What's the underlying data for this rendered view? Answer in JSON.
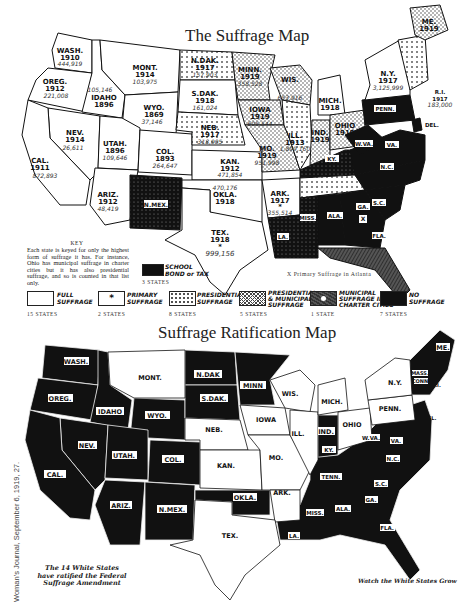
{
  "map1": {
    "title": "The Suffrage Map",
    "states": [
      {
        "abbr": "WASH.",
        "year": "1910",
        "count": "444,919",
        "category": "full"
      },
      {
        "abbr": "OREG.",
        "year": "1912",
        "count": "221,008",
        "category": "full"
      },
      {
        "abbr": "IDAHO",
        "year": "1896",
        "count": "105,146",
        "category": "full"
      },
      {
        "abbr": "MONT.",
        "year": "1914",
        "count": "103,975",
        "category": "full"
      },
      {
        "abbr": "WYO.",
        "year": "1869",
        "count": "37,146",
        "category": "full"
      },
      {
        "abbr": "NEV.",
        "year": "1914",
        "count": "26,611",
        "category": "full"
      },
      {
        "abbr": "CAL.",
        "year": "1911",
        "count": "872,893",
        "category": "full"
      },
      {
        "abbr": "UTAH.",
        "year": "1896",
        "count": "109,646",
        "category": "full"
      },
      {
        "abbr": "COL.",
        "year": "1893",
        "count": "264,647",
        "category": "full"
      },
      {
        "abbr": "ARIZ.",
        "year": "1912",
        "count": "48,419",
        "category": "full"
      },
      {
        "abbr": "N.MEX.",
        "year": "",
        "count": "",
        "category": "school-bond-tax"
      },
      {
        "abbr": "KAN.",
        "year": "1912",
        "count": "471,854",
        "category": "full"
      },
      {
        "abbr": "OKLA.",
        "year": "1918",
        "count": "470,176",
        "category": "full"
      },
      {
        "abbr": "TEX.",
        "year": "1918",
        "count": "999,156",
        "category": "primary"
      },
      {
        "abbr": "ARK.",
        "year": "1917",
        "count": "355,514",
        "category": "primary"
      },
      {
        "abbr": "N.DAK.",
        "year": "1917",
        "count": "157,903",
        "category": "presidential-municipal"
      },
      {
        "abbr": "S.DAK.",
        "year": "1918",
        "count": "161,024",
        "category": "full"
      },
      {
        "abbr": "NEB.",
        "year": "1917",
        "count": "318,905",
        "category": "presidential-municipal"
      },
      {
        "abbr": "MINN.",
        "year": "1919",
        "count": "358,528",
        "category": "presidential"
      },
      {
        "abbr": "WIS.",
        "year": "",
        "count": "653,916",
        "category": "presidential"
      },
      {
        "abbr": "IOWA",
        "year": "1919",
        "count": "605,544",
        "category": "presidential"
      },
      {
        "abbr": "MO.",
        "year": "1919",
        "count": "951,998",
        "category": "presidential"
      },
      {
        "abbr": "ILL.",
        "year": "1913",
        "count": "1,899,160",
        "category": "presidential-municipal"
      },
      {
        "abbr": "MICH.",
        "year": "1918",
        "count": "",
        "category": "full"
      },
      {
        "abbr": "IND.",
        "year": "1919",
        "count": "850,484",
        "category": "presidential"
      },
      {
        "abbr": "OHIO",
        "year": "1919",
        "count": "",
        "category": "presidential"
      },
      {
        "abbr": "N.Y.",
        "year": "1917",
        "count": "3,125,999",
        "category": "full"
      },
      {
        "abbr": "ME.",
        "year": "1919",
        "count": "",
        "category": "presidential"
      },
      {
        "abbr": "R.I.",
        "year": "1917",
        "count": "183,000",
        "category": "presidential"
      },
      {
        "abbr": "VT.",
        "year": "1917",
        "count": "",
        "category": "presidential-municipal"
      },
      {
        "abbr": "PENN.",
        "year": "",
        "count": "",
        "category": "none"
      },
      {
        "abbr": "DEL.",
        "year": "",
        "count": "",
        "category": "none"
      },
      {
        "abbr": "W.VA.",
        "year": "",
        "count": "",
        "category": "none"
      },
      {
        "abbr": "VA.",
        "year": "",
        "count": "",
        "category": "none"
      },
      {
        "abbr": "KY.",
        "year": "",
        "count": "",
        "category": "school-bond-tax"
      },
      {
        "abbr": "TENN.",
        "year": "1919",
        "count": "",
        "category": "presidential-municipal"
      },
      {
        "abbr": "N.C.",
        "year": "",
        "count": "",
        "category": "none"
      },
      {
        "abbr": "S.C.",
        "year": "",
        "count": "",
        "category": "none"
      },
      {
        "abbr": "GA.",
        "year": "",
        "count": "",
        "category": "none"
      },
      {
        "abbr": "ALA.",
        "year": "",
        "count": "",
        "category": "none"
      },
      {
        "abbr": "MISS.",
        "year": "",
        "count": "",
        "category": "school-bond-tax"
      },
      {
        "abbr": "LA.",
        "year": "",
        "count": "",
        "category": "school-bond-tax"
      },
      {
        "abbr": "FLA.",
        "year": "",
        "count": "",
        "category": "municipal-charter"
      }
    ],
    "key": {
      "heading": "KEY",
      "text": "Each state is keyed for only the highest form of suffrage it has. For instance, Ohio has municipal suffrage in charter cities but it has also presidential suffrage, and so is counted in that list only."
    },
    "school_bond_tax": {
      "label_line1": "SCHOOL",
      "label_line2": "BOND or TAX",
      "count": "3 STATES"
    },
    "atlanta_note": "X Primary Suffrage in Atlanta",
    "legend": [
      {
        "id": "full",
        "line1": "FULL",
        "line2": "SUFFRAGE",
        "count": "15 STATES"
      },
      {
        "id": "primary",
        "line1": "PRIMARY",
        "line2": "SUFFRAGE",
        "count": "2 STATES",
        "symbol": "*"
      },
      {
        "id": "presidential",
        "line1": "PRESIDENTIAL",
        "line2": "SUFFRAGE",
        "count": "8 STATES"
      },
      {
        "id": "presidential-municipal",
        "line1": "PRESIDENTIAL",
        "line2": "& MUNICIPAL",
        "line3": "SUFFRAGE",
        "count": "5 STATES"
      },
      {
        "id": "municipal-charter",
        "line1": "MUNICIPAL",
        "line2": "SUFFRAGE IN",
        "line3": "CHARTER CITIES",
        "count": "1 STATE"
      },
      {
        "id": "none",
        "line1": "NO",
        "line2": "SUFFRAGE",
        "count": "7 STATES"
      }
    ]
  },
  "map2": {
    "title": "Suffrage Ratification Map",
    "ratified_states": [
      "MONT.",
      "NEB.",
      "KAN.",
      "IOWA",
      "MO.",
      "WIS.",
      "ILL.",
      "MICH.",
      "OHIO",
      "PENN.",
      "N.Y.",
      "ARK.",
      "TEX.",
      "N.H."
    ],
    "unratified_labels": [
      "WASH.",
      "OREG.",
      "IDAHO",
      "WYO.",
      "N.DAK.",
      "S.DAK.",
      "MINN",
      "NEV.",
      "UTAH.",
      "COL.",
      "CAL.",
      "ARIZ.",
      "N.MEX.",
      "OKLA.",
      "IND.",
      "KY.",
      "W.VA.",
      "VA.",
      "N.C.",
      "TENN.",
      "S.C.",
      "GA.",
      "ALA.",
      "MISS.",
      "LA.",
      "FLA.",
      "ME.",
      "VT.",
      "MASS.",
      "CONN.",
      "R.I.",
      "DEL.",
      "MD."
    ],
    "caption_left": [
      "The 14 White States",
      "have ratified the Federal",
      "Suffrage Amendment"
    ],
    "caption_right": "Watch the White States Grow"
  },
  "credit": "Woman's Journal, September 6, 1919, 27."
}
